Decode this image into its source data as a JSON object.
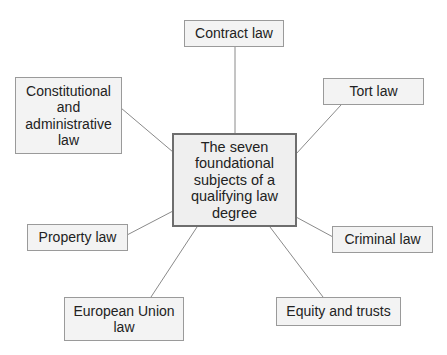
{
  "diagram": {
    "type": "mind-map",
    "center": {
      "label": "The seven\nfoundational\nsubjects of a\nqualifying law\ndegree"
    },
    "subjects": [
      {
        "id": "contract",
        "label": "Contract law"
      },
      {
        "id": "constitutional",
        "label": "Constitutional\nand\nadministrative\nlaw"
      },
      {
        "id": "tort",
        "label": "Tort law"
      },
      {
        "id": "property",
        "label": "Property law"
      },
      {
        "id": "criminal",
        "label": "Criminal law"
      },
      {
        "id": "eu",
        "label": "European Union\nlaw"
      },
      {
        "id": "equity",
        "label": "Equity and trusts"
      }
    ],
    "colors": {
      "box_fill": "#f3f3f3",
      "box_border": "#9a9a9a",
      "center_border": "#6e6e6e",
      "connector": "#8a8a8a"
    }
  }
}
